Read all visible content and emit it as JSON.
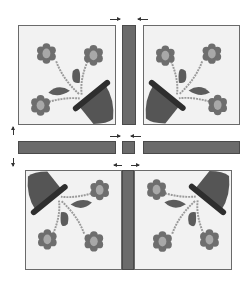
{
  "diagram": {
    "colors": {
      "background": "#f2f2f2",
      "sashing": "#6b6b6b",
      "petal": "#6e6e6e",
      "flower_center": "#a8a8a8",
      "pot": "#555555",
      "pot_rim": "#2e2e2e",
      "leaf": "#5c5c5c",
      "stem": "#9a9a9a"
    },
    "blocks": [
      {
        "id": "top-left",
        "pot_orientation": "bottom-right"
      },
      {
        "id": "top-right",
        "pot_orientation": "bottom-left"
      },
      {
        "id": "bottom-left",
        "pot_orientation": "top-right"
      },
      {
        "id": "bottom-right",
        "pot_orientation": "top-left"
      }
    ],
    "sashing": [
      "vertical-top",
      "horizontal-left",
      "cornerstone",
      "horizontal-right",
      "vertical-bottom"
    ],
    "arrows": [
      "join-top-sash",
      "join-cornerstone",
      "join-bottom-sash",
      "join-rows"
    ]
  }
}
